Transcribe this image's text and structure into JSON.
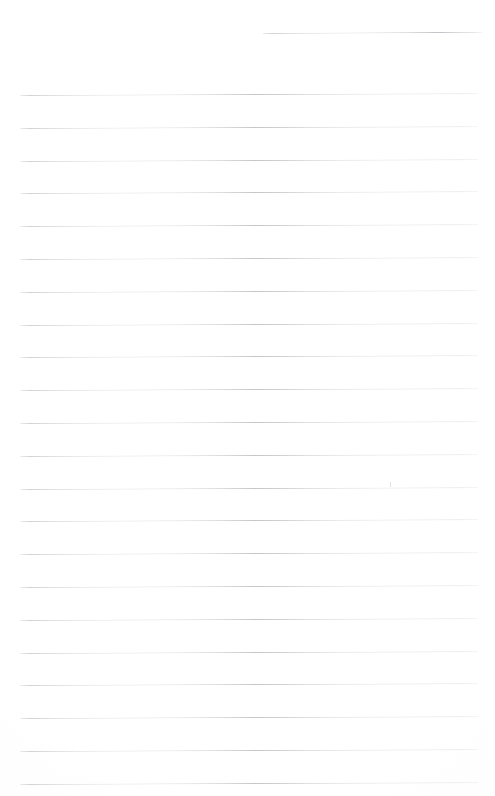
{
  "page": {
    "kind": "blank-lined-notebook-paper",
    "width": 495,
    "height": 796,
    "background_color": "#fefefe",
    "rule_color": "#c6c7ca",
    "text_content": "",
    "visible_text": []
  },
  "header_rule": {
    "name": "header-rule",
    "x": 263,
    "y": 33,
    "width": 220,
    "rotation_deg": -0.35,
    "color": "#c2c3c6"
  },
  "body_rules": {
    "count": 22,
    "left": 20,
    "width": 458,
    "first_y": 95,
    "spacing": 32.8,
    "color": "#c6c7ca",
    "rotation_deg": -0.22,
    "lines": [
      {
        "index": 1,
        "y": 95.0,
        "x": 20,
        "width": 458
      },
      {
        "index": 2,
        "y": 127.8,
        "x": 20,
        "width": 458
      },
      {
        "index": 3,
        "y": 160.6,
        "x": 20,
        "width": 458
      },
      {
        "index": 4,
        "y": 193.4,
        "x": 20,
        "width": 458
      },
      {
        "index": 5,
        "y": 226.2,
        "x": 20,
        "width": 458
      },
      {
        "index": 6,
        "y": 259.0,
        "x": 20,
        "width": 458
      },
      {
        "index": 7,
        "y": 291.8,
        "x": 20,
        "width": 458
      },
      {
        "index": 8,
        "y": 324.6,
        "x": 20,
        "width": 458
      },
      {
        "index": 9,
        "y": 357.4,
        "x": 20,
        "width": 458
      },
      {
        "index": 10,
        "y": 390.2,
        "x": 20,
        "width": 458
      },
      {
        "index": 11,
        "y": 423.0,
        "x": 20,
        "width": 458
      },
      {
        "index": 12,
        "y": 455.8,
        "x": 20,
        "width": 458
      },
      {
        "index": 13,
        "y": 488.6,
        "x": 20,
        "width": 458
      },
      {
        "index": 14,
        "y": 521.4,
        "x": 20,
        "width": 458
      },
      {
        "index": 15,
        "y": 554.2,
        "x": 20,
        "width": 458
      },
      {
        "index": 16,
        "y": 587.0,
        "x": 20,
        "width": 458
      },
      {
        "index": 17,
        "y": 619.8,
        "x": 20,
        "width": 458
      },
      {
        "index": 18,
        "y": 652.6,
        "x": 20,
        "width": 458
      },
      {
        "index": 19,
        "y": 685.4,
        "x": 20,
        "width": 458
      },
      {
        "index": 20,
        "y": 718.2,
        "x": 20,
        "width": 458
      },
      {
        "index": 21,
        "y": 751.0,
        "x": 20,
        "width": 458
      },
      {
        "index": 22,
        "y": 783.8,
        "x": 20,
        "width": 458
      }
    ]
  },
  "stray_marks": [
    {
      "name": "faint-tick-mark",
      "x": 390,
      "y": 482,
      "width": 1,
      "height": 5,
      "color": "#e3e3e4"
    }
  ]
}
